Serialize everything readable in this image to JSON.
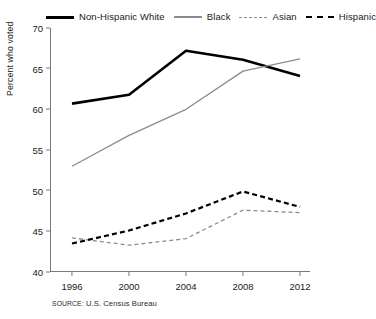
{
  "legend": {
    "items": [
      {
        "label": "Non-Hispanic White",
        "swatch": "thick-solid-black-line-icon",
        "color": "#000000",
        "style": "solid"
      },
      {
        "label": "Black",
        "swatch": "thin-solid-gray-line-icon",
        "color": "#8c8c8c",
        "style": "solid"
      },
      {
        "label": "Asian",
        "swatch": "gray-dashed-line-icon",
        "color": "#8c8c8c",
        "style": "dashed"
      },
      {
        "label": "Hispanic",
        "swatch": "black-dashed-line-icon",
        "color": "#000000",
        "style": "dashed"
      }
    ]
  },
  "axes": {
    "ylabel": "Percent who voted",
    "yticks": [
      "70",
      "65",
      "60",
      "55",
      "50",
      "45",
      "40"
    ],
    "xticks": [
      "1996",
      "2000",
      "2004",
      "2008",
      "2012"
    ]
  },
  "source": {
    "keyword": "SOURCE:",
    "text": " U.S. Census Bureau"
  },
  "chart_data": {
    "type": "line",
    "title": "",
    "xlabel": "",
    "ylabel": "Percent who voted",
    "x": [
      1996,
      2000,
      2004,
      2008,
      2012
    ],
    "categories": [
      "1996",
      "2000",
      "2004",
      "2008",
      "2012"
    ],
    "ylim": [
      40,
      70
    ],
    "xlim": [
      1994,
      2014
    ],
    "ytick_step": 5,
    "grid": false,
    "legend_position": "top",
    "series": [
      {
        "name": "Non-Hispanic White",
        "values": [
          60.7,
          61.8,
          67.2,
          66.1,
          64.1
        ],
        "color": "#000000",
        "style": "solid",
        "width": 2.6
      },
      {
        "name": "Black",
        "values": [
          53.0,
          56.8,
          60.0,
          64.7,
          66.2
        ],
        "color": "#8c8c8c",
        "style": "solid",
        "width": 1.3
      },
      {
        "name": "Asian",
        "values": [
          44.2,
          43.3,
          44.1,
          47.6,
          47.3
        ],
        "color": "#8c8c8c",
        "style": "dashed",
        "width": 1.3
      },
      {
        "name": "Hispanic",
        "values": [
          43.5,
          45.1,
          47.2,
          49.9,
          48.0
        ],
        "color": "#000000",
        "style": "dashed",
        "width": 2.2
      }
    ],
    "annotations": [
      "SOURCE: U.S. Census Bureau"
    ]
  }
}
